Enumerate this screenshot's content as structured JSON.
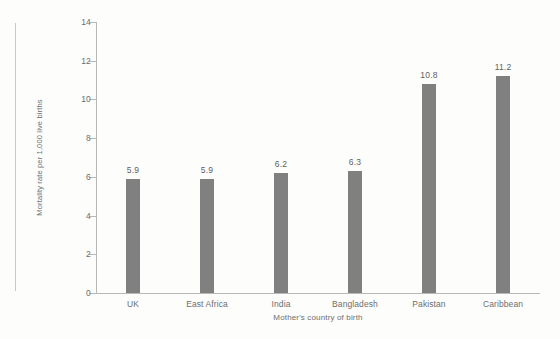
{
  "chart_data": {
    "type": "bar",
    "title": "",
    "xlabel": "Mother's country of birth",
    "ylabel": "Mortality rate per 1,000 live births",
    "categories": [
      "UK",
      "East Africa",
      "India",
      "Bangladesh",
      "Pakistan",
      "Caribbean"
    ],
    "values": [
      5.9,
      5.9,
      6.2,
      6.3,
      10.8,
      11.2
    ],
    "value_labels": [
      "5.9",
      "5.9",
      "6.2",
      "6.3",
      "10.8",
      "11.2"
    ],
    "ylim": [
      0,
      14
    ],
    "ytick_labels": [
      "0",
      "2",
      "4",
      "6",
      "8",
      "10",
      "12",
      "14"
    ],
    "ytick_values": [
      0,
      2,
      4,
      6,
      8,
      10,
      12,
      14
    ],
    "grid": false,
    "legend": false,
    "legend_position": "none",
    "bar_color": "#808080",
    "axis_color": "#b8b8b8",
    "text_color": "#6e6e6e",
    "background_color": "#fdfdfc"
  }
}
